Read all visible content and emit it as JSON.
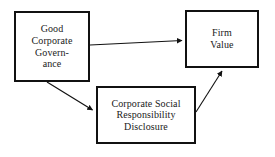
{
  "diagram": {
    "background_color": "#ffffff",
    "border_color": "#111111",
    "text_color": "#1a1a1a",
    "nodes": [
      {
        "id": "good-corporate-governance",
        "label": "Good\nCorporate\nGovern-\nance"
      },
      {
        "id": "firm-value",
        "label": "Firm\nValue"
      },
      {
        "id": "corporate-social-responsibility-disclosure",
        "label": "Corporate Social\nResponsibility\nDisclosure"
      }
    ],
    "edges": [
      {
        "id": "gcg-to-firm-value",
        "from": "good-corporate-governance",
        "to": "firm-value",
        "label": "",
        "arrowhead": "solid-triangle"
      },
      {
        "id": "gcg-to-csr",
        "from": "good-corporate-governance",
        "to": "corporate-social-responsibility-disclosure",
        "label": "",
        "arrowhead": "solid-triangle"
      },
      {
        "id": "csr-to-firm-value",
        "from": "corporate-social-responsibility-disclosure",
        "to": "firm-value",
        "label": "",
        "arrowhead": "solid-triangle"
      }
    ]
  }
}
